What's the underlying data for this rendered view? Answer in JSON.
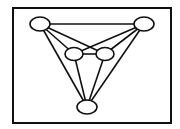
{
  "diagram": {
    "type": "graph",
    "colors": {
      "stroke": "#111111",
      "fill": "#ffffff",
      "background": "#ffffff"
    },
    "frame": {
      "x": 13,
      "y": 8,
      "width": 158,
      "height": 115
    },
    "nodes": [
      {
        "id": "top-left",
        "cx": 40,
        "cy": 24,
        "rx": 10,
        "ry": 7
      },
      {
        "id": "top-right",
        "cx": 144,
        "cy": 24,
        "rx": 10,
        "ry": 7
      },
      {
        "id": "center-left",
        "cx": 74,
        "cy": 54,
        "rx": 9,
        "ry": 6.5
      },
      {
        "id": "center-right",
        "cx": 105,
        "cy": 54,
        "rx": 9,
        "ry": 6.5
      },
      {
        "id": "bottom",
        "cx": 87,
        "cy": 107,
        "rx": 10,
        "ry": 7
      }
    ],
    "edges": [
      {
        "from": "top-left",
        "to": "top-right"
      },
      {
        "from": "top-left",
        "to": "center-left"
      },
      {
        "from": "top-left",
        "to": "center-right"
      },
      {
        "from": "top-left",
        "to": "bottom"
      },
      {
        "from": "top-right",
        "to": "center-left"
      },
      {
        "from": "top-right",
        "to": "center-right"
      },
      {
        "from": "top-right",
        "to": "bottom"
      },
      {
        "from": "center-left",
        "to": "center-right"
      },
      {
        "from": "center-left",
        "to": "bottom"
      },
      {
        "from": "center-right",
        "to": "bottom"
      }
    ]
  }
}
